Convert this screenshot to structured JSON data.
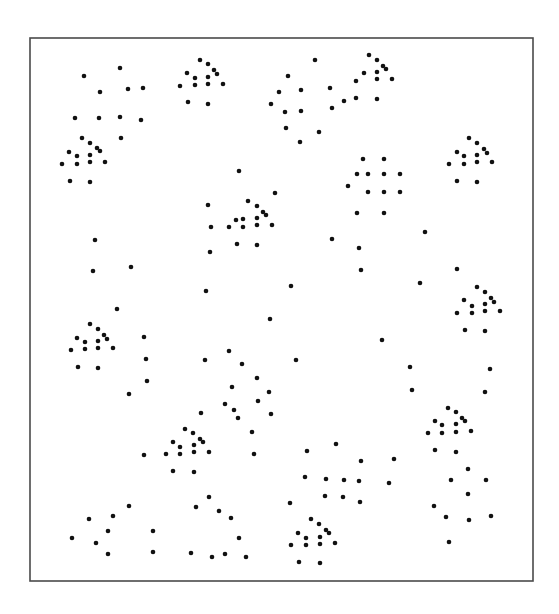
{
  "figure": {
    "width": 559,
    "height": 614,
    "background": "#ffffff",
    "frame": {
      "x": 30,
      "y": 38,
      "width": 503,
      "height": 543,
      "stroke": "#4a4a4a",
      "stroke_width": 1.6
    },
    "dot_color": "#111111",
    "dot_radius": 2.3
  },
  "dots": [
    [
      84,
      76
    ],
    [
      120,
      68
    ],
    [
      100,
      92
    ],
    [
      128,
      89
    ],
    [
      143,
      88
    ],
    [
      75,
      118
    ],
    [
      99,
      118
    ],
    [
      120,
      117
    ],
    [
      141,
      120
    ],
    [
      121,
      138
    ],
    [
      82,
      138
    ],
    [
      90,
      143
    ],
    [
      97,
      148
    ],
    [
      100,
      151
    ],
    [
      69,
      152
    ],
    [
      77,
      156
    ],
    [
      90,
      155
    ],
    [
      105,
      162
    ],
    [
      62,
      164
    ],
    [
      77,
      164
    ],
    [
      90,
      162
    ],
    [
      70,
      181
    ],
    [
      90,
      182
    ],
    [
      200,
      60
    ],
    [
      208,
      64
    ],
    [
      214,
      70
    ],
    [
      217,
      74
    ],
    [
      187,
      73
    ],
    [
      195,
      78
    ],
    [
      208,
      77
    ],
    [
      223,
      84
    ],
    [
      180,
      86
    ],
    [
      195,
      85
    ],
    [
      208,
      84
    ],
    [
      188,
      102
    ],
    [
      208,
      104
    ],
    [
      315,
      60
    ],
    [
      288,
      76
    ],
    [
      330,
      88
    ],
    [
      279,
      92
    ],
    [
      301,
      90
    ],
    [
      271,
      104
    ],
    [
      285,
      112
    ],
    [
      301,
      111
    ],
    [
      332,
      108
    ],
    [
      286,
      128
    ],
    [
      319,
      132
    ],
    [
      300,
      142
    ],
    [
      369,
      55
    ],
    [
      377,
      60
    ],
    [
      383,
      66
    ],
    [
      386,
      69
    ],
    [
      356,
      81
    ],
    [
      364,
      73
    ],
    [
      377,
      72
    ],
    [
      377,
      79
    ],
    [
      392,
      79
    ],
    [
      344,
      101
    ],
    [
      356,
      98
    ],
    [
      377,
      99
    ],
    [
      469,
      138
    ],
    [
      477,
      143
    ],
    [
      484,
      149
    ],
    [
      487,
      153
    ],
    [
      457,
      152
    ],
    [
      464,
      156
    ],
    [
      477,
      155
    ],
    [
      492,
      162
    ],
    [
      449,
      164
    ],
    [
      464,
      164
    ],
    [
      477,
      162
    ],
    [
      457,
      181
    ],
    [
      477,
      182
    ],
    [
      363,
      159
    ],
    [
      384,
      159
    ],
    [
      357,
      174
    ],
    [
      368,
      174
    ],
    [
      384,
      174
    ],
    [
      400,
      174
    ],
    [
      348,
      186
    ],
    [
      368,
      192
    ],
    [
      384,
      192
    ],
    [
      400,
      192
    ],
    [
      357,
      213
    ],
    [
      384,
      213
    ],
    [
      239,
      171
    ],
    [
      275,
      193
    ],
    [
      208,
      205
    ],
    [
      248,
      201
    ],
    [
      257,
      206
    ],
    [
      263,
      212
    ],
    [
      266,
      215
    ],
    [
      236,
      220
    ],
    [
      243,
      219
    ],
    [
      257,
      218
    ],
    [
      229,
      227
    ],
    [
      243,
      227
    ],
    [
      257,
      225
    ],
    [
      272,
      225
    ],
    [
      211,
      227
    ],
    [
      237,
      244
    ],
    [
      257,
      245
    ],
    [
      210,
      252
    ],
    [
      95,
      240
    ],
    [
      93,
      271
    ],
    [
      131,
      267
    ],
    [
      206,
      291
    ],
    [
      291,
      286
    ],
    [
      270,
      319
    ],
    [
      425,
      232
    ],
    [
      332,
      239
    ],
    [
      359,
      248
    ],
    [
      361,
      270
    ],
    [
      457,
      269
    ],
    [
      420,
      283
    ],
    [
      477,
      287
    ],
    [
      485,
      292
    ],
    [
      491,
      298
    ],
    [
      494,
      302
    ],
    [
      464,
      300
    ],
    [
      472,
      306
    ],
    [
      485,
      304
    ],
    [
      457,
      313
    ],
    [
      472,
      313
    ],
    [
      485,
      311
    ],
    [
      500,
      311
    ],
    [
      465,
      330
    ],
    [
      485,
      331
    ],
    [
      117,
      309
    ],
    [
      90,
      324
    ],
    [
      98,
      329
    ],
    [
      104,
      335
    ],
    [
      107,
      339
    ],
    [
      77,
      338
    ],
    [
      85,
      342
    ],
    [
      98,
      341
    ],
    [
      71,
      350
    ],
    [
      85,
      349
    ],
    [
      98,
      348
    ],
    [
      113,
      348
    ],
    [
      78,
      367
    ],
    [
      98,
      368
    ],
    [
      144,
      337
    ],
    [
      146,
      359
    ],
    [
      147,
      381
    ],
    [
      129,
      394
    ],
    [
      382,
      340
    ],
    [
      296,
      360
    ],
    [
      410,
      367
    ],
    [
      490,
      369
    ],
    [
      412,
      390
    ],
    [
      485,
      392
    ],
    [
      229,
      351
    ],
    [
      205,
      360
    ],
    [
      242,
      364
    ],
    [
      257,
      378
    ],
    [
      232,
      387
    ],
    [
      269,
      392
    ],
    [
      258,
      401
    ],
    [
      225,
      404
    ],
    [
      234,
      410
    ],
    [
      238,
      418
    ],
    [
      201,
      413
    ],
    [
      271,
      414
    ],
    [
      252,
      432
    ],
    [
      254,
      454
    ],
    [
      185,
      429
    ],
    [
      193,
      433
    ],
    [
      200,
      439
    ],
    [
      203,
      442
    ],
    [
      173,
      442
    ],
    [
      180,
      447
    ],
    [
      194,
      445
    ],
    [
      209,
      452
    ],
    [
      144,
      455
    ],
    [
      166,
      454
    ],
    [
      180,
      454
    ],
    [
      194,
      452
    ],
    [
      173,
      471
    ],
    [
      194,
      472
    ],
    [
      448,
      408
    ],
    [
      456,
      412
    ],
    [
      462,
      418
    ],
    [
      465,
      421
    ],
    [
      435,
      421
    ],
    [
      442,
      425
    ],
    [
      456,
      424
    ],
    [
      471,
      431
    ],
    [
      428,
      433
    ],
    [
      442,
      433
    ],
    [
      456,
      432
    ],
    [
      435,
      450
    ],
    [
      456,
      452
    ],
    [
      307,
      451
    ],
    [
      336,
      444
    ],
    [
      361,
      461
    ],
    [
      394,
      459
    ],
    [
      305,
      477
    ],
    [
      326,
      479
    ],
    [
      344,
      480
    ],
    [
      359,
      481
    ],
    [
      389,
      483
    ],
    [
      325,
      496
    ],
    [
      343,
      497
    ],
    [
      360,
      502
    ],
    [
      290,
      503
    ],
    [
      468,
      469
    ],
    [
      451,
      480
    ],
    [
      486,
      480
    ],
    [
      468,
      494
    ],
    [
      434,
      506
    ],
    [
      446,
      517
    ],
    [
      469,
      520
    ],
    [
      491,
      516
    ],
    [
      449,
      542
    ],
    [
      311,
      519
    ],
    [
      319,
      524
    ],
    [
      326,
      530
    ],
    [
      329,
      533
    ],
    [
      298,
      533
    ],
    [
      306,
      538
    ],
    [
      320,
      537
    ],
    [
      335,
      543
    ],
    [
      291,
      545
    ],
    [
      306,
      545
    ],
    [
      320,
      544
    ],
    [
      299,
      562
    ],
    [
      320,
      563
    ],
    [
      209,
      497
    ],
    [
      196,
      507
    ],
    [
      219,
      511
    ],
    [
      231,
      518
    ],
    [
      239,
      538
    ],
    [
      191,
      553
    ],
    [
      212,
      557
    ],
    [
      225,
      554
    ],
    [
      246,
      557
    ],
    [
      153,
      531
    ],
    [
      153,
      552
    ],
    [
      129,
      506
    ],
    [
      89,
      519
    ],
    [
      113,
      516
    ],
    [
      108,
      531
    ],
    [
      72,
      538
    ],
    [
      96,
      543
    ],
    [
      108,
      554
    ]
  ]
}
